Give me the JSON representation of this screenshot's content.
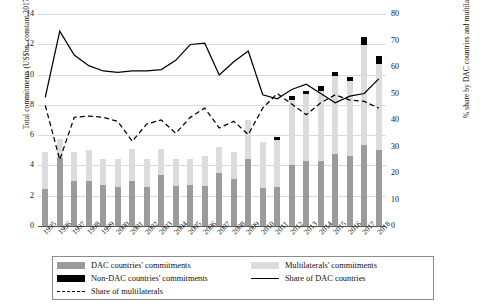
{
  "chart_data": {
    "type": "bar",
    "title": "",
    "xlabel": "",
    "ylabel": "Total commitments (US$bn, constant 2017 prices)",
    "ylabel_secondary": "% share by DAC countries and multilaterals",
    "ylim": [
      0,
      14
    ],
    "yticks": [
      0,
      2,
      4,
      6,
      8,
      10,
      12,
      14
    ],
    "ylim_secondary": [
      0,
      80
    ],
    "yticks_secondary": [
      0,
      10,
      20,
      30,
      40,
      50,
      60,
      70,
      80
    ],
    "grid": true,
    "legend_position": "bottom",
    "categories": [
      "1995",
      "1996",
      "1997",
      "1998",
      "1999",
      "2000",
      "2001",
      "2002",
      "2003",
      "2004",
      "2005",
      "2006",
      "2007",
      "2008",
      "2009",
      "2010",
      "2011",
      "2012",
      "2013",
      "2014",
      "2015",
      "2016",
      "2017",
      "2018"
    ],
    "stacked": true,
    "series": [
      {
        "name": "DAC countries' commitments",
        "type": "bar",
        "color": "#9b9b9b",
        "axis": "left",
        "values": [
          2.45,
          4.5,
          2.95,
          2.95,
          2.7,
          2.6,
          2.95,
          2.55,
          3.35,
          2.65,
          2.7,
          2.65,
          3.5,
          3.1,
          4.45,
          2.5,
          2.55,
          4.0,
          4.3,
          4.3,
          4.75,
          4.6,
          5.35,
          5.05
        ]
      },
      {
        "name": "Multilaterals' commitments",
        "type": "bar",
        "color": "#dcdcdc",
        "axis": "left",
        "values": [
          2.45,
          1.25,
          1.95,
          2.05,
          1.75,
          1.85,
          2.15,
          1.9,
          1.75,
          1.8,
          1.75,
          1.95,
          1.7,
          1.8,
          2.55,
          3.05,
          3.15,
          4.35,
          4.4,
          4.6,
          5.15,
          4.95,
          6.6,
          5.65
        ]
      },
      {
        "name": "Non-DAC countries' commitments",
        "type": "bar",
        "color": "#000000",
        "axis": "left",
        "values": [
          0,
          0,
          0,
          0,
          0,
          0,
          0,
          0,
          0,
          0,
          0,
          0,
          0,
          0,
          0,
          0,
          0.18,
          0.22,
          0.2,
          0.35,
          0.28,
          0.3,
          0.55,
          0.5
        ]
      },
      {
        "name": "Share of DAC countries",
        "type": "line",
        "style": "solid",
        "color": "#000000",
        "axis": "right",
        "values": [
          48.5,
          73.5,
          64.5,
          60.5,
          58.5,
          58.0,
          58.5,
          58.5,
          59.0,
          62.5,
          68.5,
          69.0,
          57.0,
          62.0,
          66.0,
          49.5,
          48.0,
          51.5,
          53.5,
          50.0,
          46.5,
          49.0,
          50.0,
          55.5
        ]
      },
      {
        "name": "Share of multilaterals",
        "type": "line",
        "style": "dashed",
        "color": "#000000",
        "axis": "right",
        "values": [
          45.5,
          25.0,
          41.0,
          41.5,
          41.0,
          39.5,
          32.0,
          38.5,
          40.0,
          35.0,
          41.0,
          44.5,
          37.0,
          39.5,
          34.5,
          44.5,
          50.0,
          46.0,
          42.0,
          46.5,
          49.5,
          47.5,
          47.0,
          44.5
        ]
      }
    ]
  },
  "legend": {
    "items": [
      {
        "label": "DAC countries' commitments",
        "marker": "swatch-grey"
      },
      {
        "label": "Multilaterals' commitments",
        "marker": "swatch-light-grey"
      },
      {
        "label": "Non-DAC countries' commitments",
        "marker": "swatch-black"
      },
      {
        "label": "Share of DAC countries",
        "marker": "solid-line"
      },
      {
        "label": "Share of multilaterals",
        "marker": "dashed-line"
      }
    ]
  },
  "colors": {
    "dac": "#9b9b9b",
    "multilaterals": "#dcdcdc",
    "non_dac": "#000000",
    "gridline": "#d9d9d9",
    "axis": "#595959"
  }
}
